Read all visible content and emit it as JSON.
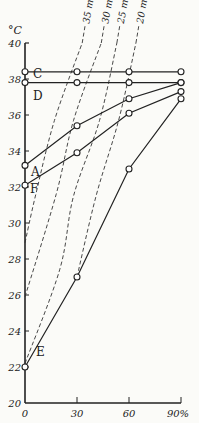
{
  "chart_data": {
    "type": "line",
    "title": "",
    "xlabel": "%",
    "ylabel": "°C",
    "xlim": [
      0,
      90
    ],
    "ylim": [
      20,
      40
    ],
    "grid": false,
    "x_ticks": [
      "0",
      "30",
      "60",
      "90%"
    ],
    "y_ticks": [
      "20",
      "22",
      "24",
      "26",
      "28",
      "30",
      "32",
      "34",
      "36",
      "38",
      "40"
    ],
    "x": [
      0,
      30,
      60,
      90
    ],
    "series": [
      {
        "name": "C",
        "style": "solid-markers",
        "values": [
          38.4,
          38.4,
          38.4,
          38.4
        ]
      },
      {
        "name": "D",
        "style": "solid-markers",
        "values": [
          37.8,
          37.8,
          37.8,
          37.8
        ]
      },
      {
        "name": "A",
        "style": "solid-markers",
        "values": [
          33.2,
          35.4,
          36.9,
          37.8
        ]
      },
      {
        "name": "F",
        "style": "solid-markers",
        "values": [
          32.1,
          33.9,
          36.1,
          37.3
        ]
      },
      {
        "name": "E",
        "style": "solid-markers",
        "values": [
          22.0,
          27.0,
          33.0,
          36.9
        ]
      }
    ],
    "dashed_curves": [
      {
        "name": "35 mm.",
        "points": [
          [
            0,
            28.9
          ],
          [
            6,
            31.5
          ],
          [
            17,
            35.7
          ],
          [
            33,
            40
          ]
        ]
      },
      {
        "name": "30 mm.",
        "points": [
          [
            0,
            25.9
          ],
          [
            18,
            31.6
          ],
          [
            28,
            35.7
          ],
          [
            44,
            40
          ]
        ]
      },
      {
        "name": "25 mm.",
        "points": [
          [
            0,
            22.2
          ],
          [
            20,
            27.4
          ],
          [
            28,
            31.5
          ],
          [
            43,
            35.7
          ],
          [
            53,
            40
          ]
        ]
      },
      {
        "name": "20 mm.",
        "points": [
          [
            30,
            27.0
          ],
          [
            41,
            31.5
          ],
          [
            54,
            35.7
          ],
          [
            64,
            40
          ]
        ]
      }
    ],
    "annotations": [
      "C",
      "D",
      "A",
      "F",
      "E",
      "35 mm.",
      "30 mm.",
      "25 mm.",
      "20 mm."
    ]
  },
  "labels": {
    "y_unit": "°C",
    "x_unit": "%"
  }
}
